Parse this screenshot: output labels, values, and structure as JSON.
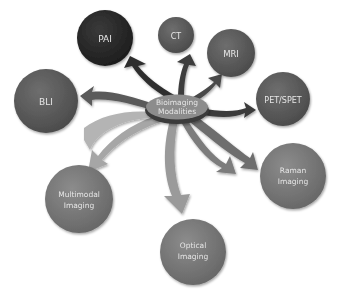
{
  "diagram": {
    "center": {
      "line1": "Bioimaging",
      "line2": "Modalities"
    },
    "nodes": [
      {
        "id": "pai",
        "line1": "PAI",
        "line2": ""
      },
      {
        "id": "ct",
        "line1": "CT",
        "line2": ""
      },
      {
        "id": "mri",
        "line1": "MRI",
        "line2": ""
      },
      {
        "id": "bli",
        "line1": "BLI",
        "line2": ""
      },
      {
        "id": "petspet",
        "line1": "PET/SPET",
        "line2": ""
      },
      {
        "id": "raman",
        "line1": "Raman",
        "line2": "Imaging"
      },
      {
        "id": "multimodal",
        "line1": "Multimodal",
        "line2": "Imaging"
      },
      {
        "id": "optical",
        "line1": "Optical",
        "line2": "Imaging"
      }
    ],
    "colors": {
      "node_dark": "#2b2b2b",
      "node_mid": "#5a5a5a",
      "node_light": "#7a7a7a",
      "arrow_dark": "#333333",
      "arrow_mid": "#6a6a6a",
      "arrow_light": "#a8a8a8",
      "center_fill": "#8a8a8a"
    }
  }
}
